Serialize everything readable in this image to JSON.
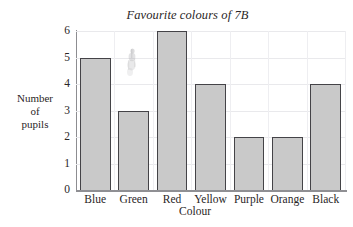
{
  "page": {
    "cut_off_text_top": "ng graph"
  },
  "chart_data": {
    "type": "bar",
    "title": "Favourite colours of 7B",
    "xlabel": "Colour",
    "ylabel": "Number of pupils",
    "ylabel_lines": [
      "Number",
      "of",
      "pupils"
    ],
    "categories": [
      "Blue",
      "Green",
      "Red",
      "Yellow",
      "Purple",
      "Orange",
      "Black"
    ],
    "values": [
      5,
      3,
      6,
      4,
      2,
      2,
      4
    ],
    "ylim": [
      0,
      6
    ],
    "yticks": [
      0,
      1,
      2,
      3,
      4,
      5,
      6
    ],
    "ytick_labels": [
      "0",
      "1",
      "2",
      "3",
      "4",
      "5",
      "6"
    ],
    "grid": true,
    "legend": false,
    "bar_fill_color": "#c9c9c9",
    "bar_border_color": "#444347",
    "gridline_color": "#e9e9ec",
    "axis_color": "#8d8d91",
    "text_color": "#2a2626"
  },
  "artifacts": {
    "smudge_label": "scan-smudge"
  }
}
